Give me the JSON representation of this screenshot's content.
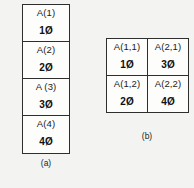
{
  "figure": {
    "background_color": "#f3f3f1",
    "line_color": "#2e2e2e",
    "cell_fill_color": "#fdfdfc"
  },
  "panel_a": {
    "caption": "(a)",
    "type": "one-dimensional-array",
    "cells": [
      {
        "name": "A(1)",
        "value": "1Ø"
      },
      {
        "name": "A(2)",
        "value": "2Ø"
      },
      {
        "name": "A (3)",
        "value": "3Ø"
      },
      {
        "name": "A(4)",
        "value": "4Ø"
      }
    ]
  },
  "panel_b": {
    "caption": "(b)",
    "type": "two-dimensional-array",
    "rows": [
      [
        {
          "name": "A(1,1)",
          "value": "1Ø"
        },
        {
          "name": "A(2,1)",
          "value": "3Ø"
        }
      ],
      [
        {
          "name": "A(1,2)",
          "value": "2Ø"
        },
        {
          "name": "A(2,2)",
          "value": "4Ø"
        }
      ]
    ]
  }
}
